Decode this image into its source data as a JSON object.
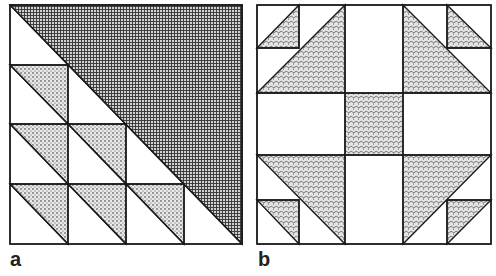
{
  "figure": {
    "panels": [
      {
        "id": "a",
        "label": "a",
        "description": "Triangles quilt block: diagonal half cross-hatched, lower-left half of dotted half-square triangles"
      },
      {
        "id": "b",
        "label": "b",
        "description": "Shoo-fly style quilt block with dotted triangles and center square"
      }
    ],
    "colors": {
      "line": "#1a1a1a",
      "background": "#ffffff",
      "dotted_fill": "#bdbdbd",
      "hatch_fill": "#555555"
    }
  }
}
